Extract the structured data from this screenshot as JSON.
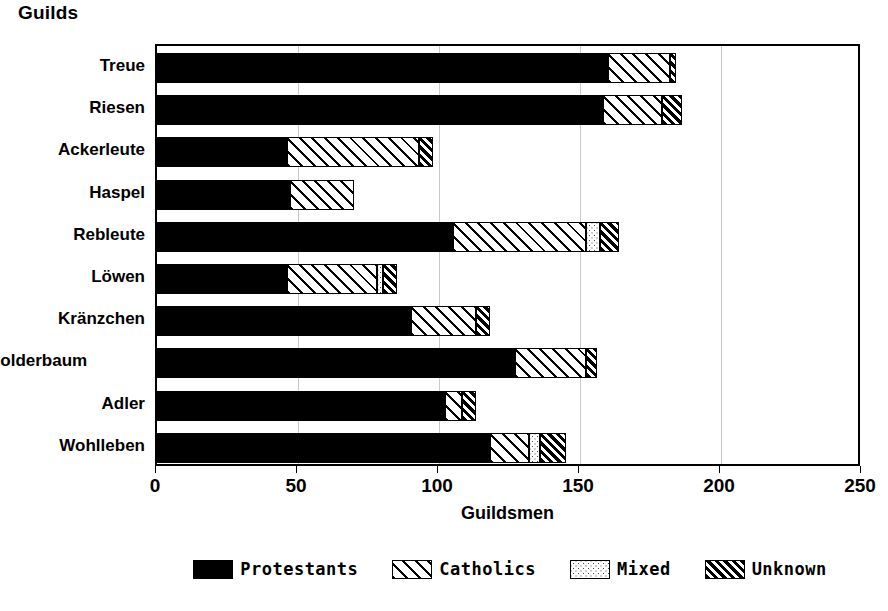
{
  "chart_data": {
    "type": "bar",
    "orientation": "horizontal",
    "stacked": true,
    "title": "Guilds",
    "xlabel": "Guildsmen",
    "ylabel": "Guilds",
    "xlim": [
      0,
      250
    ],
    "xticks": [
      0,
      50,
      100,
      150,
      200,
      250
    ],
    "grid": true,
    "legend_position": "bottom",
    "categories": [
      "Treue",
      "Riesen",
      "Ackerleute",
      "Haspel",
      "Rebleute",
      "Löwen",
      "Kränzchen",
      "Holderbaum",
      "Adler",
      "Wohlleben"
    ],
    "series": [
      {
        "name": "Protestants",
        "fill": "solid-black",
        "values": [
          160,
          158,
          46,
          47,
          105,
          46,
          90,
          127,
          102,
          118
        ]
      },
      {
        "name": "Catholics",
        "fill": "diagonal-hatch-wide",
        "values": [
          22,
          21,
          47,
          23,
          47,
          32,
          23,
          25,
          6,
          14
        ]
      },
      {
        "name": "Mixed",
        "fill": "dotted",
        "values": [
          0,
          0,
          0,
          0,
          5,
          2,
          0,
          0,
          0,
          4
        ]
      },
      {
        "name": "Unknown",
        "fill": "diagonal-hatch-dense",
        "values": [
          2,
          7,
          5,
          0,
          7,
          5,
          5,
          4,
          5,
          9
        ]
      }
    ],
    "totals": [
      184,
      186,
      98,
      70,
      164,
      85,
      118,
      156,
      113,
      145
    ]
  },
  "legend": {
    "items": [
      {
        "label": "Protestants"
      },
      {
        "label": "Catholics"
      },
      {
        "label": "Mixed"
      },
      {
        "label": "Unknown"
      }
    ]
  },
  "axis": {
    "x_title": "Guildsmen",
    "tick_labels": [
      "0",
      "50",
      "100",
      "150",
      "200",
      "250"
    ]
  },
  "colors": {
    "ink": "#000000",
    "paper": "#ffffff",
    "grid": "#c9c9c9"
  }
}
